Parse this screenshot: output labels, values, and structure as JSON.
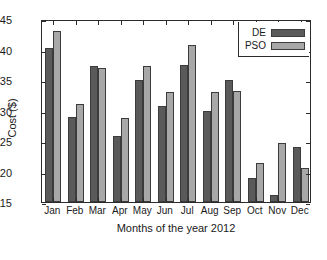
{
  "chart_data": {
    "type": "bar",
    "title": "",
    "xlabel": "Months of the year 2012",
    "ylabel": "Cost ($)",
    "categories": [
      "Jan",
      "Feb",
      "Mar",
      "Apr",
      "May",
      "Jun",
      "Jul",
      "Aug",
      "Sep",
      "Oct",
      "Nov",
      "Dec"
    ],
    "series": [
      {
        "name": "DE",
        "color": "#5a5a5a",
        "values": [
          140.3,
          128.9,
          137.3,
          125.8,
          135.0,
          130.8,
          137.5,
          129.9,
          135.0,
          119.0,
          116.2,
          124.0
        ]
      },
      {
        "name": "PSO",
        "color": "#a8a8a8",
        "values": [
          143.0,
          131.0,
          136.9,
          128.7,
          137.3,
          133.0,
          140.7,
          133.0,
          133.2,
          121.4,
          124.7,
          120.6
        ]
      }
    ],
    "ylim": [
      115,
      145
    ],
    "yticks": [
      115,
      120,
      125,
      130,
      135,
      140,
      145
    ],
    "ytick_labels": [
      "115",
      "120",
      "125",
      "130",
      "135",
      "140",
      "145"
    ],
    "grid": false,
    "legend_position": "top-right",
    "axis_color": "#2b2b2b",
    "background": "#ffffff"
  }
}
